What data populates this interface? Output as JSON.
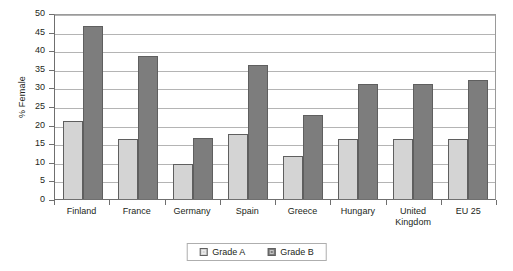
{
  "chart_data": {
    "type": "bar",
    "title": "",
    "xlabel": "",
    "ylabel": "% Female",
    "ylim": [
      0,
      50
    ],
    "ytick_step": 5,
    "yticks": [
      50,
      45,
      40,
      35,
      30,
      25,
      20,
      15,
      10,
      5,
      0
    ],
    "grid": true,
    "legend_position": "bottom-center",
    "categories": [
      "Finland",
      "France",
      "Germany",
      "Spain",
      "Greece",
      "Hungary",
      "United Kingdom",
      "EU 25"
    ],
    "series": [
      {
        "name": "Grade A",
        "color": "#d4d4d4",
        "values": [
          21,
          16,
          9.5,
          17.5,
          11.5,
          16,
          16,
          16
        ]
      },
      {
        "name": "Grade B",
        "color": "#7d7d7d",
        "values": [
          46.5,
          38.5,
          16.5,
          36,
          22.5,
          31,
          31,
          32
        ]
      }
    ]
  },
  "legend": {
    "items": [
      {
        "label": "Grade A",
        "swatch": "series-a"
      },
      {
        "label": "Grade B",
        "swatch": "series-b"
      }
    ]
  }
}
